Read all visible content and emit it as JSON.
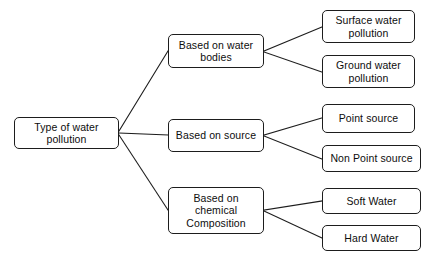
{
  "diagram": {
    "type": "tree-hierarchy",
    "orientation": "left-to-right",
    "background_color": "#ffffff",
    "line_color": "#1d1d1d",
    "text_color": "#0d0d0d",
    "root": {
      "id": "root",
      "label": "Type of water\npollution"
    },
    "branches": [
      {
        "id": "bodies",
        "label": "Based on water\nbodies",
        "leaves": [
          {
            "id": "surface",
            "label": "Surface water\npollution"
          },
          {
            "id": "ground",
            "label": "Ground water\npollution"
          }
        ]
      },
      {
        "id": "source",
        "label": "Based on source",
        "leaves": [
          {
            "id": "point",
            "label": "Point source"
          },
          {
            "id": "nonpoint",
            "label": "Non Point source"
          }
        ]
      },
      {
        "id": "chemical",
        "label": "Based on\nchemical\nComposition",
        "leaves": [
          {
            "id": "soft",
            "label": "Soft Water"
          },
          {
            "id": "hard",
            "label": "Hard Water"
          }
        ]
      }
    ]
  }
}
